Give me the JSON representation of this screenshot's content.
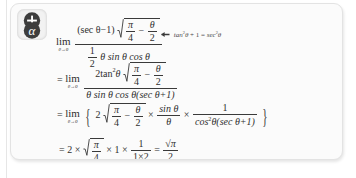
{
  "card": {
    "background_color": "#fbfbfb",
    "border_color": "#e3e3e3"
  },
  "badge": {
    "icon_name": "alpha-plus-badge-icon",
    "plus_symbol": "+",
    "alpha_symbol": "α"
  },
  "annotation": {
    "arrow": "←",
    "identity_lhs_fn": "tan",
    "identity_lhs_exp": "2",
    "identity_lhs_var": "θ",
    "identity_plus": "+ 1 =",
    "identity_rhs_fn": "sec",
    "identity_rhs_exp": "2",
    "identity_rhs_var": "θ",
    "full_text": "← tan²θ + 1 = sec²θ"
  },
  "line1": {
    "lim_word": "lim",
    "lim_sub": "θ→0",
    "num_lead": "(sec θ−1)",
    "rad_num": "π",
    "rad_den": "4",
    "rad_minus": "−",
    "rad_num2": "θ",
    "rad_den2": "2",
    "den_half_num": "1",
    "den_half_den": "2",
    "den_rest": "θ sin θ cos θ",
    "full_text": "lim(θ→0) (secθ−1)√(π/4 − θ/2) / (½ θ sinθ cosθ)"
  },
  "line2": {
    "equals": "=",
    "lim_word": "lim",
    "lim_sub": "θ→0",
    "num_lead": "2tan",
    "num_exp": "2",
    "num_var": "θ",
    "rad_num": "π",
    "rad_den": "4",
    "rad_minus": "−",
    "rad_num2": "θ",
    "rad_den2": "2",
    "den_text": "θ sin θ cos θ(sec θ+1)",
    "full_text": "= lim(θ→0) 2tan²θ√(π/4 − θ/2) / (θ sinθ cosθ(secθ+1))"
  },
  "line3": {
    "equals": "=",
    "lim_word": "lim",
    "lim_sub": "θ→0",
    "open_brace": "{",
    "coef": "2",
    "rad_num": "π",
    "rad_den": "4",
    "rad_minus": "−",
    "rad_num2": "θ",
    "rad_den2": "2",
    "times1": "×",
    "f2_num": "sin θ",
    "f2_den": "θ",
    "times2": "×",
    "f3_num": "1",
    "f3_den_lead": "cos",
    "f3_den_exp": "2",
    "f3_den_rest": "θ(sec θ+1)",
    "close_brace": "}",
    "full_text": "= lim(θ→0) [ 2√(π/4 − θ/2) × sinθ/θ × 1/(cos²θ(secθ+1)) ]"
  },
  "line4": {
    "equals": "=",
    "coef": "2",
    "times1": "×",
    "rad_num": "π",
    "rad_den": "4",
    "times2": "×",
    "one": "1",
    "times3": "×",
    "f_num": "1",
    "f_den": "1×2",
    "equals2": "=",
    "res_num": "√π",
    "res_den": "2",
    "full_text": "= 2 × √(π/4) × 1 × 1/(1×2) = √π/2"
  }
}
